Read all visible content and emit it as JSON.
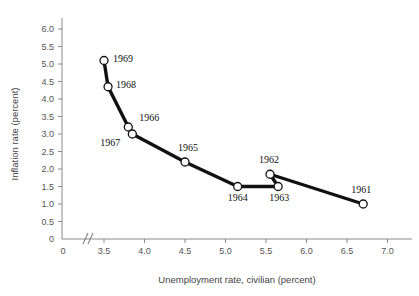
{
  "chart_data": {
    "type": "scatter",
    "title": "",
    "subtitle": "",
    "xlabel": "Unemployment rate, civilian (percent)",
    "ylabel": "Inflation rate (percent)",
    "xlim": [
      3.25,
      7.3
    ],
    "ylim": [
      0,
      6.35
    ],
    "xticks": [
      "0",
      "3.5",
      "4.0",
      "4.5",
      "5.0",
      "5.5",
      "6.0",
      "6.5",
      "7.0"
    ],
    "xtick_values": [
      0,
      3.5,
      4.0,
      4.5,
      5.0,
      5.5,
      6.0,
      6.5,
      7.0
    ],
    "yticks": [
      "0",
      "0.5",
      "1.0",
      "1.5",
      "2.0",
      "2.5",
      "3.0",
      "3.5",
      "4.0",
      "4.5",
      "5.0",
      "5.5",
      "6.0"
    ],
    "ytick_values": [
      0,
      0.5,
      1.0,
      1.5,
      2.0,
      2.5,
      3.0,
      3.5,
      4.0,
      4.5,
      5.0,
      5.5,
      6.0
    ],
    "grid": false,
    "legend": false,
    "axis_break": {
      "axis": "x",
      "glyph": "//",
      "between": [
        0,
        3.5
      ]
    },
    "connected": true,
    "marker_style": "open-circle",
    "line_color": "#111111",
    "marker_fill": "#ffffff",
    "axis_color": "#8a8a8a",
    "series": [
      {
        "name": "Phillips curve 1961-1969",
        "points": [
          {
            "label": "1961",
            "x": 6.7,
            "y": 1.0,
            "label_dx": -2,
            "label_dy": -11,
            "label_anchor": "middle"
          },
          {
            "label": "1962",
            "x": 5.55,
            "y": 1.85,
            "label_dx": -1,
            "label_dy": -11,
            "label_anchor": "middle"
          },
          {
            "label": "1963",
            "x": 5.65,
            "y": 1.5,
            "label_dx": 1,
            "label_dy": 14,
            "label_anchor": "middle"
          },
          {
            "label": "1964",
            "x": 5.15,
            "y": 1.5,
            "label_dx": 0,
            "label_dy": 14,
            "label_anchor": "middle"
          },
          {
            "label": "1965",
            "x": 4.5,
            "y": 2.2,
            "label_dx": 3,
            "label_dy": -11,
            "label_anchor": "middle"
          },
          {
            "label": "1966",
            "x": 3.8,
            "y": 3.2,
            "label_dx": 11,
            "label_dy": -6,
            "label_anchor": "start"
          },
          {
            "label": "1967",
            "x": 3.85,
            "y": 3.0,
            "label_dx": -12,
            "label_dy": 12,
            "label_anchor": "end"
          },
          {
            "label": "1968",
            "x": 3.55,
            "y": 4.35,
            "label_dx": 8,
            "label_dy": 1,
            "label_anchor": "start"
          },
          {
            "label": "1969",
            "x": 3.5,
            "y": 5.1,
            "label_dx": 9,
            "label_dy": 1,
            "label_anchor": "start"
          }
        ],
        "path_order": [
          "1969",
          "1968",
          "1966",
          "1967",
          "1965",
          "1964",
          "1963",
          "1962",
          "1961"
        ]
      }
    ]
  }
}
